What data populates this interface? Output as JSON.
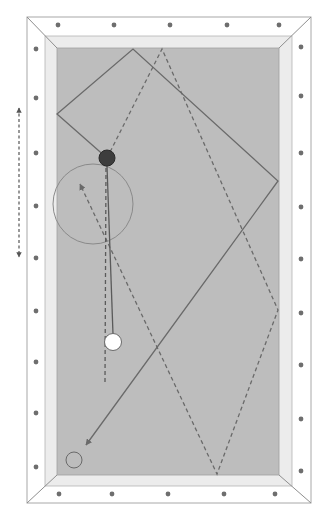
{
  "diagram": {
    "type": "billiards-shot-diagram",
    "table": {
      "frame_color": "#ffffff",
      "frame_stroke": "#9a9a9a",
      "cushion_color": "#ececec",
      "felt_color": "#bdbdbd",
      "diamond_color": "#6e6e6e",
      "diamonds_per_long_rail": 9,
      "diamonds_per_short_rail": 5
    },
    "balls": [
      {
        "name": "object-ball-dark",
        "x": 107,
        "y": 158,
        "r": 8,
        "fill": "#3d3d3d"
      },
      {
        "name": "cue-ball-white",
        "x": 113,
        "y": 342,
        "r": 8.5,
        "fill": "#ffffff"
      },
      {
        "name": "target-ball-outline",
        "x": 74,
        "y": 460,
        "r": 8,
        "fill": "#bdbdbd"
      }
    ],
    "target_zone": {
      "x": 93,
      "y": 204,
      "r": 40,
      "stroke": "#8a8a8a"
    },
    "solid_path": {
      "label": "object ball path (solid)",
      "points": [
        [
          107,
          158
        ],
        [
          57,
          114
        ],
        [
          133,
          49
        ],
        [
          278,
          181
        ],
        [
          86,
          445
        ]
      ],
      "color": "#6a6a6a"
    },
    "dashed_path": {
      "label": "alternative path (dashed)",
      "points": [
        [
          107,
          158
        ],
        [
          162,
          49
        ],
        [
          278,
          310
        ],
        [
          217,
          474
        ],
        [
          80,
          184
        ]
      ],
      "color": "#6a6a6a"
    },
    "cue_line": {
      "label": "cue ball line",
      "from": [
        113,
        334
      ],
      "to": [
        107,
        166
      ]
    },
    "cue_dashed_line": {
      "label": "cue ball follow dashed",
      "from": [
        105,
        382
      ],
      "to": [
        106,
        166
      ]
    },
    "side_arrow": {
      "label": "double-headed dashed arrow",
      "x": 19,
      "y1": 108,
      "y2": 257
    }
  }
}
